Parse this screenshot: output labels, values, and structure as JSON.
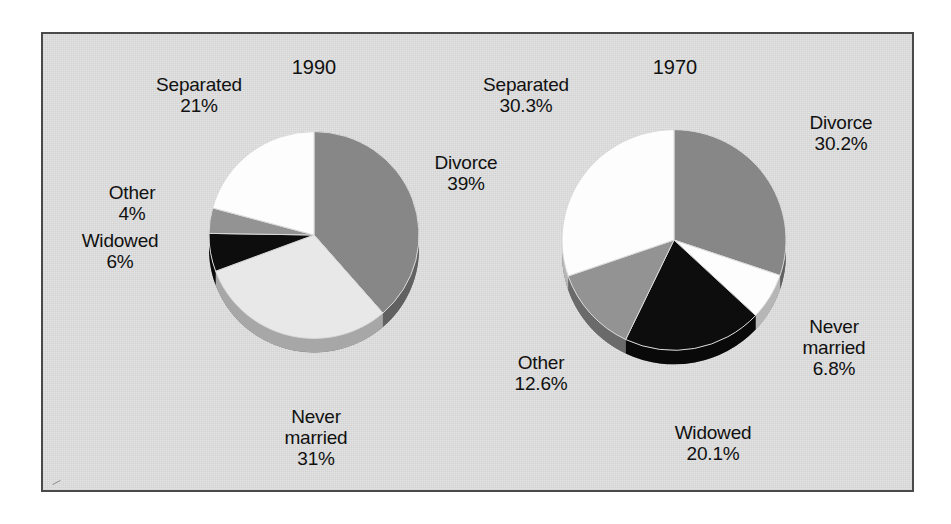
{
  "figure": {
    "background_color": "#e2e2e2",
    "border_color": "#4a4a4a",
    "page_color": "#ffffff"
  },
  "palette": {
    "divorce": "#878787",
    "never_married_1990": "#e8e8e8",
    "never_married_1970": "#fdfdfd",
    "widowed": "#0d0d0d",
    "other": "#939393",
    "separated": "#fdfdfd",
    "rim_shadow": "#6f6f6f",
    "text": "#111111"
  },
  "chart_data": [
    {
      "type": "pie",
      "title": "1990",
      "categories": [
        "Divorce",
        "Never married",
        "Widowed",
        "Other",
        "Separated"
      ],
      "values": [
        39,
        31,
        6,
        4,
        21
      ],
      "value_labels": [
        "39%",
        "31%",
        "6%",
        "4%",
        "21%"
      ],
      "colors": [
        "#878787",
        "#e8e8e8",
        "#0d0d0d",
        "#939393",
        "#fdfdfd"
      ],
      "start_angle_deg": 0,
      "direction": "clockwise",
      "legend": "none",
      "labels_position": "outside-callout",
      "center": {
        "x": 271,
        "y": 201
      },
      "radius": 105,
      "depth": 14
    },
    {
      "type": "pie",
      "title": "1970",
      "categories": [
        "Divorce",
        "Never married",
        "Widowed",
        "Other",
        "Separated"
      ],
      "values": [
        30.2,
        6.8,
        20.1,
        12.6,
        30.3
      ],
      "value_labels": [
        "30.2%",
        "6.8%",
        "20.1%",
        "12.6%",
        "30.3%"
      ],
      "colors": [
        "#878787",
        "#fdfdfd",
        "#0d0d0d",
        "#939393",
        "#fdfdfd"
      ],
      "start_angle_deg": 0,
      "direction": "clockwise",
      "legend": "none",
      "labels_position": "outside-callout",
      "center": {
        "x": 631,
        "y": 206
      },
      "radius": 112,
      "depth": 14
    }
  ],
  "charts": {
    "left": {
      "year": "1990",
      "labels": {
        "separated": "Separated\n21%",
        "divorce": "Divorce\n39%",
        "other": "Other\n4%",
        "widowed": "Widowed\n6%",
        "never_married": "Never\nmarried\n31%"
      }
    },
    "right": {
      "year": "1970",
      "labels": {
        "separated": "Separated\n30.3%",
        "divorce": "Divorce\n30.2%",
        "other": "Other\n12.6%",
        "widowed": "Widowed\n20.1%",
        "never_married": "Never\nmarried\n6.8%"
      }
    }
  }
}
